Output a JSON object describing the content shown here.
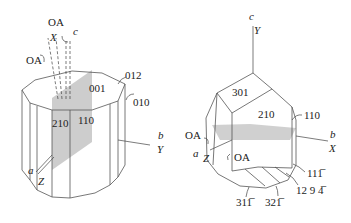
{
  "figure": {
    "left_crystal": {
      "faces": [
        "001",
        "012",
        "010",
        "210",
        "110"
      ],
      "axes": {
        "c": "c",
        "b": "b",
        "Y": "Y",
        "a": "a",
        "Z": "Z",
        "X": "X"
      },
      "optic_axes": [
        "OA",
        "OA"
      ]
    },
    "right_crystal": {
      "faces": [
        "301",
        "210",
        "110",
        "11̅",
        "12 9 4̅",
        "31̅",
        "32̅"
      ],
      "face_labels_display": {
        "f301": "301",
        "f210": "210",
        "f110": "110",
        "f11_1": "111̅",
        "f12_9_4": "12 9 4̅",
        "f31_1": "311̅",
        "f32_1": "321̅"
      },
      "axes": {
        "c": "c",
        "Y": "Y",
        "b": "b",
        "X": "X",
        "a": "a",
        "Z": "Z"
      },
      "optic_axes": [
        "OA",
        "OA"
      ]
    },
    "colors": {
      "shade": "#c8c8c8",
      "line": "#555555",
      "background": "#ffffff"
    }
  }
}
